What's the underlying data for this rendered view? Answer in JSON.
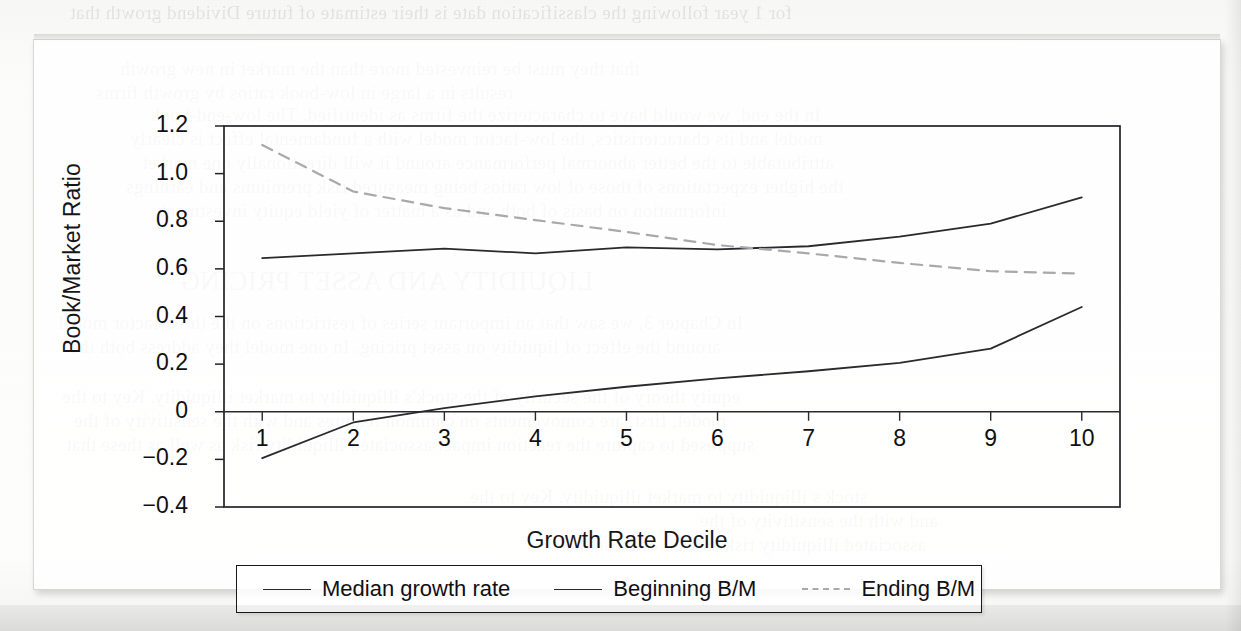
{
  "chart_data": {
    "type": "line",
    "title": "",
    "xlabel": "Growth Rate Decile",
    "ylabel": "Book/Market Ratio",
    "categories": [
      "1",
      "2",
      "3",
      "4",
      "5",
      "6",
      "7",
      "8",
      "9",
      "10"
    ],
    "x": [
      1,
      2,
      3,
      4,
      5,
      6,
      7,
      8,
      9,
      10
    ],
    "xlim": [
      0.6,
      10.4
    ],
    "ylim": [
      -0.4,
      1.2
    ],
    "yticks": [
      "1.2",
      "1.0",
      "0.8",
      "0.6",
      "0.4",
      "0.2",
      "0",
      "−0.2",
      "−0.4"
    ],
    "ytick_values": [
      1.2,
      1.0,
      0.8,
      0.6,
      0.4,
      0.2,
      0,
      -0.2,
      -0.4
    ],
    "grid": false,
    "legend_position": "below-axes",
    "series": [
      {
        "name": "Median growth rate",
        "style": "solid",
        "color": "#2a2a2e",
        "values": [
          -0.195,
          -0.045,
          0.015,
          0.065,
          0.105,
          0.14,
          0.17,
          0.205,
          0.265,
          0.44
        ]
      },
      {
        "name": "Beginning B/M",
        "style": "solid",
        "color": "#2a2a2e",
        "values": [
          0.645,
          0.665,
          0.685,
          0.665,
          0.69,
          0.682,
          0.695,
          0.735,
          0.79,
          0.9
        ]
      },
      {
        "name": "Ending B/M",
        "style": "dashed",
        "color": "#a9a9ad",
        "values": [
          1.12,
          0.925,
          0.855,
          0.805,
          0.755,
          0.7,
          0.665,
          0.625,
          0.59,
          0.58
        ]
      }
    ]
  },
  "axis": {
    "ylabel": "Book/Market Ratio",
    "xlabel": "Growth Rate Decile",
    "ytick_labels": [
      "1.2",
      "1.0",
      "0.8",
      "0.6",
      "0.4",
      "0.2",
      "0",
      "−0.2",
      "−0.4"
    ],
    "xtick_labels": [
      "1",
      "2",
      "3",
      "4",
      "5",
      "6",
      "7",
      "8",
      "9",
      "10"
    ]
  },
  "legend": {
    "entries": [
      {
        "label": "Median growth rate",
        "style": "solid"
      },
      {
        "label": "Beginning B/M",
        "style": "solid"
      },
      {
        "label": "Ending B/M",
        "style": "dashed"
      }
    ]
  },
  "page_bleed": [
    {
      "text": "for 1 year following the classification date is their estimate of future Dividend growth that",
      "x": 70,
      "y": 2,
      "size": 19
    },
    {
      "text": "that they must be reinvested more than the market in new growth",
      "x": 120,
      "y": 58,
      "size": 19
    },
    {
      "text": "results in a large in low-book ratios by growth firms",
      "x": 96,
      "y": 82,
      "size": 19
    },
    {
      "text": "In the end, we would have to characterize the firms as identified. The low-end-book",
      "x": 150,
      "y": 104,
      "size": 19
    },
    {
      "text": "model and its characteristics, the low-factor model with a fundamental effect is clearly",
      "x": 130,
      "y": 128,
      "size": 19
    },
    {
      "text": "attributable to the better abnormal performance around it will directionally one market",
      "x": 142,
      "y": 152,
      "size": 19
    },
    {
      "text": "the higher expectations of those of low ratios being measured risk premiums and earnings",
      "x": 126,
      "y": 176,
      "size": 19
    },
    {
      "text": "information on basis of both and as a matter of yield equity investment",
      "x": 160,
      "y": 200,
      "size": 19
    },
    {
      "text": "LIQUIDITY AND ASSET PRICING",
      "x": 180,
      "y": 266,
      "size": 27
    },
    {
      "text": "In Chapter 3, we saw that an important series of restrictions on the three-factor model",
      "x": 58,
      "y": 312,
      "size": 19
    },
    {
      "text": "around the effect of liquidity on asset pricing. In one model they address both the",
      "x": 70,
      "y": 336,
      "size": 19
    },
    {
      "text": "equity theory of the security of the stock's illiquidity to market illiquidity. Key to the",
      "x": 62,
      "y": 386,
      "size": 19
    },
    {
      "text": "model, first, are comovements on common features and with the sensitivity of the",
      "x": 74,
      "y": 410,
      "size": 19
    },
    {
      "text": "supposed to capture the reaction impact associated illiquidity risk as well as these that",
      "x": 66,
      "y": 434,
      "size": 19
    },
    {
      "text": "stock s illiquidity to market illiquidity. Key to the",
      "x": 470,
      "y": 486,
      "size": 19
    },
    {
      "text": "and with the sensitivity of the",
      "x": 700,
      "y": 510,
      "size": 19
    },
    {
      "text": "associated illiquidity risk as well as these that",
      "x": 560,
      "y": 534,
      "size": 19
    }
  ]
}
